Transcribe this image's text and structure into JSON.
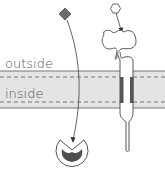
{
  "diagram": {
    "labels": {
      "outside": "outside",
      "inside": "inside"
    },
    "elements": [
      {
        "name": "ligand-diamond",
        "shape": "diamond",
        "color": "#6b6b6b"
      },
      {
        "name": "ligand-hexagon",
        "shape": "hexagon",
        "color": "#ffffff"
      },
      {
        "name": "membrane-receptor",
        "shape": "transmembrane-protein"
      },
      {
        "name": "intracellular-receptor",
        "shape": "pac-man-receptor"
      }
    ],
    "colors": {
      "membrane_fill": "#e4e4e4",
      "line": "#666666",
      "dark": "#555555",
      "background": "#ffffff"
    }
  }
}
